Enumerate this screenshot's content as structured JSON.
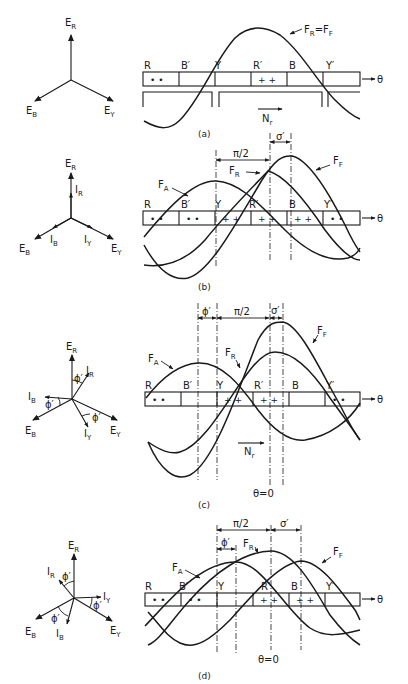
{
  "figure": {
    "panels": [
      {
        "id": "a",
        "caption": "(a)",
        "phasors": {
          "er": "E",
          "er_sub": "R",
          "eb": "E",
          "eb_sub": "B",
          "ey": "E",
          "ey_sub": "Y"
        },
        "coils": [
          "R",
          "B′",
          "Y",
          "R′",
          "B",
          "Y′"
        ],
        "coil_marks": [
          "• •",
          "",
          "",
          "+ +",
          "",
          ""
        ],
        "axis_label": "θ",
        "wave_labels": {
          "main": "F",
          "main_sub": "R",
          "eq": "=",
          "ff": "F",
          "ff_sub": "F"
        },
        "rotation_label": "N",
        "rotation_sub": "r"
      },
      {
        "id": "b",
        "caption": "(b)",
        "phasors": {
          "er": "E",
          "er_sub": "R",
          "ir": "I",
          "ir_sub": "R",
          "eb": "E",
          "eb_sub": "B",
          "ib": "I",
          "ib_sub": "B",
          "ey": "E",
          "ey_sub": "Y",
          "iy": "I",
          "iy_sub": "Y"
        },
        "coils": [
          "R",
          "B′",
          "Y",
          "R′",
          "B",
          "Y′"
        ],
        "coil_marks": [
          "• •",
          "• •",
          "+ +",
          "+ +",
          "+ +",
          "• •"
        ],
        "axis_label": "θ",
        "wave_labels": {
          "fa": "F",
          "fa_sub": "A",
          "fr": "F",
          "fr_sub": "R",
          "ff": "F",
          "ff_sub": "F"
        },
        "dimensions": {
          "pi_half": "π/2",
          "sigma": "σ′"
        }
      },
      {
        "id": "c",
        "caption": "(c)",
        "phasors": {
          "er": "E",
          "er_sub": "R",
          "ir": "I",
          "ir_sub": "R",
          "eb": "E",
          "eb_sub": "B",
          "ib": "I",
          "ib_sub": "B",
          "ey": "E",
          "ey_sub": "Y",
          "iy": "I",
          "iy_sub": "Y",
          "phi": "ϕ′"
        },
        "coils": [
          "R",
          "B′",
          "Y",
          "R′",
          "B",
          "Y′"
        ],
        "coil_marks": [
          "• •",
          "",
          "+ +",
          "+ +",
          "",
          "• •"
        ],
        "axis_label": "θ",
        "wave_labels": {
          "fa": "F",
          "fa_sub": "A",
          "fr": "F",
          "fr_sub": "R",
          "ff": "F",
          "ff_sub": "F"
        },
        "dimensions": {
          "phi": "ϕ′",
          "pi_half": "π/2",
          "sigma": "σ′"
        },
        "rotation_label": "N",
        "rotation_sub": "r",
        "origin_label": "θ=0"
      },
      {
        "id": "d",
        "caption": "(d)",
        "phasors": {
          "er": "E",
          "er_sub": "R",
          "ir": "I",
          "ir_sub": "R",
          "eb": "E",
          "eb_sub": "B",
          "ib": "I",
          "ib_sub": "B",
          "ey": "E",
          "ey_sub": "Y",
          "iy": "I",
          "iy_sub": "Y",
          "phi": "ϕ′"
        },
        "coils": [
          "R",
          "B′",
          "Y",
          "R′",
          "B",
          "Y′"
        ],
        "coil_marks": [
          "• •",
          "• •",
          "",
          "+ +",
          "+ +",
          ""
        ],
        "axis_label": "θ",
        "wave_labels": {
          "fa": "F",
          "fa_sub": "A",
          "fr": "F",
          "fr_sub": "R",
          "ff": "F",
          "ff_sub": "F"
        },
        "dimensions": {
          "phi": "ϕ′",
          "pi_half": "π/2",
          "sigma": "σ′"
        },
        "origin_label": "θ=0"
      }
    ]
  }
}
